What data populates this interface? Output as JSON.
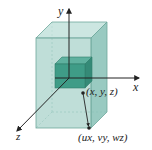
{
  "diagram": {
    "type": "3d-scaling-illustration",
    "axes": {
      "x_label": "x",
      "y_label": "y",
      "z_label": "z"
    },
    "points": {
      "original": "(x, y, z)",
      "scaled": "(ux, vy, wz)"
    },
    "objects": {
      "outer_box": "scaled box",
      "inner_cube": "original unit cube"
    },
    "colors": {
      "outer_front": "#a9d3cb",
      "outer_top": "#c3e2dc",
      "outer_side": "#8ec4ba",
      "inner_front": "#3f9c87",
      "inner_top": "#5fb19f",
      "inner_side": "#358a77",
      "edge": "#6fa79c",
      "axis": "#222222"
    }
  }
}
